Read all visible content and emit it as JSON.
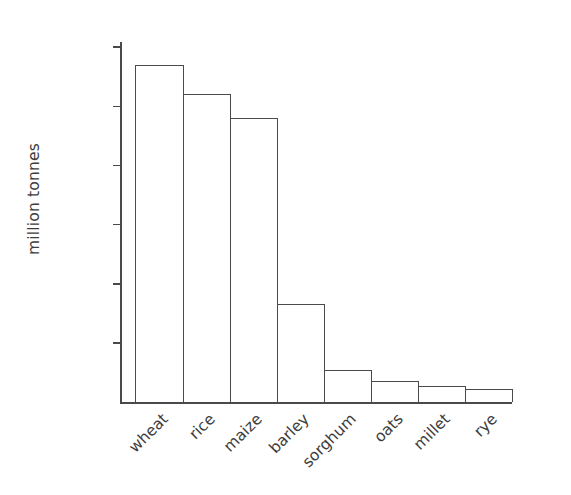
{
  "chart_data": {
    "type": "bar",
    "title": "",
    "subtitle": "",
    "xlabel": "",
    "ylabel": "million tonnes",
    "categories": [
      "wheat",
      "rice",
      "maize",
      "barley",
      "sorghum",
      "oats",
      "millet",
      "rye"
    ],
    "values": [
      570,
      520,
      480,
      165,
      55,
      35,
      27,
      22
    ],
    "ylim": [
      0,
      620
    ],
    "yticks": [
      100,
      200,
      300,
      400,
      500,
      600
    ],
    "ytick_labels": [
      "100",
      "200",
      "300",
      "400",
      "500",
      "600"
    ],
    "grid": false,
    "legend": false,
    "legend_position": "none",
    "series": [
      {
        "name": "world cereal production",
        "values": [
          570,
          520,
          480,
          165,
          55,
          35,
          27,
          22
        ]
      }
    ],
    "units": "million tonnes",
    "bar_fill_color": "#ffffff",
    "bar_edge_color": "#4a4a4a",
    "axis_color": "#4a4a4a",
    "text_color": "#3d3d3d",
    "background_color": "#ffffff"
  }
}
